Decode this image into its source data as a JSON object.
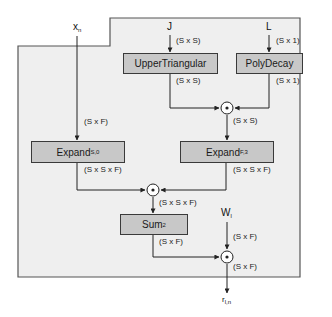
{
  "inputs": {
    "x": {
      "base": "x",
      "sub": "n"
    },
    "j": {
      "base": "J"
    },
    "l": {
      "base": "L"
    },
    "w": {
      "base": "W",
      "sub": "l"
    }
  },
  "output": {
    "base": "r",
    "sub": "l,n"
  },
  "blocks": {
    "upper_triangular": {
      "label": "UpperTriangular"
    },
    "poly_decay": {
      "label": "PolyDecay"
    },
    "expand_s0": {
      "base": "Expand",
      "sub": "S,0"
    },
    "expand_f3": {
      "base": "Expand",
      "sub": "F,3"
    },
    "sum2": {
      "base": "Sum",
      "sub": "2"
    }
  },
  "operators": {
    "hadamard_symbol": "⊙"
  },
  "shape_labels": {
    "x_to_expand": "(S x F)",
    "j_to_upper": "(S x S)",
    "l_to_poly": "(S x 1)",
    "upper_out": "(S x S)",
    "poly_out": "(S x 1)",
    "odot1_out": "(S x S)",
    "expand_s0_out": "(S x S x F)",
    "expand_f3_out": "(S x S x F)",
    "odot2_out": "(S x S x F)",
    "sum_out": "(S x F)",
    "w_in": "(S x F)",
    "odot3_out": "(S x F)"
  },
  "colors": {
    "frame_fill": "#efefef",
    "frame_stroke": "#555555",
    "box_fill": "#c8c8c8",
    "line": "#222222"
  }
}
